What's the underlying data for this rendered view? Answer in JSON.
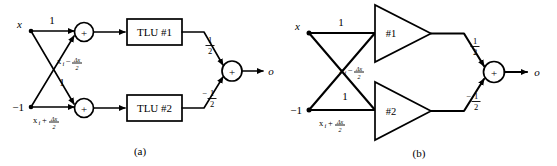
{
  "figure": {
    "type": "two-panel circuit diagram",
    "panels": [
      {
        "id": "a",
        "caption": "(a)",
        "inputs": [
          {
            "label": "x",
            "name": "input-x"
          },
          {
            "label": "−1",
            "name": "input-minus-one"
          }
        ],
        "edge_labels": {
          "top_direct": "1",
          "cross_to_bottom": "1",
          "upper_expr_num": "x",
          "upper_expr_sub": "i",
          "upper_expr_op": "−",
          "upper_expr_frac_num": "Δx",
          "upper_expr_frac_den": "2",
          "lower_expr_num": "x",
          "lower_expr_sub": "i",
          "lower_expr_op": "+",
          "lower_expr_frac_num": "Δx",
          "lower_expr_frac_den": "2"
        },
        "units": [
          {
            "label": "TLU #1",
            "name": "tlu-1",
            "shape": "box"
          },
          {
            "label": "TLU #2",
            "name": "tlu-2",
            "shape": "box"
          }
        ],
        "output_weights": {
          "top_sign": "",
          "top_num": "1",
          "top_den": "2",
          "bottom_sign": "−",
          "bottom_num": "1",
          "bottom_den": "2"
        },
        "summers": [
          {
            "symbol": "+",
            "name": "summer-top"
          },
          {
            "symbol": "+",
            "name": "summer-bottom"
          },
          {
            "symbol": "+",
            "name": "summer-output"
          }
        ],
        "output_label": "o"
      },
      {
        "id": "b",
        "caption": "(b)",
        "inputs": [
          {
            "label": "x",
            "name": "input-x"
          },
          {
            "label": "−1",
            "name": "input-minus-one"
          }
        ],
        "edge_labels": {
          "top_direct": "1",
          "cross_to_bottom": "1",
          "upper_expr_num": "x",
          "upper_expr_sub": "i",
          "upper_expr_op": "−",
          "upper_expr_frac_num": "Δx",
          "upper_expr_frac_den": "2",
          "lower_expr_num": "x",
          "lower_expr_sub": "i",
          "lower_expr_op": "+",
          "lower_expr_frac_num": "Δx",
          "lower_expr_frac_den": "2"
        },
        "units": [
          {
            "label": "#1",
            "name": "amplifier-1",
            "shape": "triangle"
          },
          {
            "label": "#2",
            "name": "amplifier-2",
            "shape": "triangle"
          }
        ],
        "output_weights": {
          "top_sign": "",
          "top_num": "1",
          "top_den": "2",
          "bottom_sign": "−",
          "bottom_num": "1",
          "bottom_den": "2"
        },
        "summers": [
          {
            "symbol": "+",
            "name": "summer-output"
          }
        ],
        "output_label": "o"
      }
    ]
  }
}
